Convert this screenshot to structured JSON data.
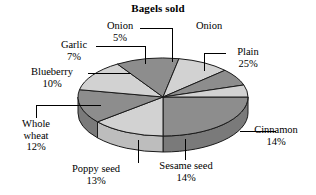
{
  "title": "Bagels sold",
  "colors": {
    "background": "#ffffff",
    "outline": "#1a1a1a",
    "slice_light": "#d2d2d2",
    "slice_dark": "#8d8d8d",
    "side_light": "#bdbdbd",
    "side_dark": "#7a7a7a",
    "leader": "#000000",
    "text": "#000000"
  },
  "chart_data": {
    "type": "pie",
    "title": "Bagels sold",
    "xlabel": "",
    "ylabel": "",
    "unit": "%",
    "legend": "labels-with-leader-lines",
    "grid": false,
    "three_d": true,
    "start_angle_deg": 0,
    "direction": "clockwise",
    "categories": [
      "Plain",
      "Cinnamon",
      "Sesame seed",
      "Poppy seed",
      "Whole wheat",
      "Blueberry",
      "Garlic",
      "Onion"
    ],
    "values": [
      25,
      14,
      14,
      13,
      12,
      10,
      7,
      5
    ],
    "slices": [
      {
        "label": "Plain",
        "percent": 25,
        "percent_text": "25%",
        "shade": "dark"
      },
      {
        "label": "Cinnamon",
        "percent": 14,
        "percent_text": "14%",
        "shade": "light"
      },
      {
        "label": "Sesame seed",
        "percent": 14,
        "percent_text": "14%",
        "shade": "dark"
      },
      {
        "label": "Poppy seed",
        "percent": 13,
        "percent_text": "13%",
        "shade": "light"
      },
      {
        "label": "Whole wheat",
        "percent": 12,
        "percent_text": "12%",
        "shade": "dark"
      },
      {
        "label": "Blueberry",
        "percent": 10,
        "percent_text": "10%",
        "shade": "light"
      },
      {
        "label": "Garlic",
        "percent": 7,
        "percent_text": "7%",
        "shade": "dark"
      },
      {
        "label": "Onion",
        "percent": 5,
        "percent_text": "5%",
        "shade": "light"
      }
    ]
  },
  "labels": {
    "onion": {
      "name": "Onion",
      "percent": "5%"
    },
    "garlic": {
      "name": "Garlic",
      "percent": "7%"
    },
    "blueberry": {
      "name": "Blueberry",
      "percent": "10%"
    },
    "whole_wheat": {
      "name_line1": "Whole",
      "name_line2": "wheat",
      "percent": "12%"
    },
    "poppy_seed": {
      "name": "Poppy seed",
      "percent": "13%"
    },
    "sesame_seed": {
      "name": "Sesame seed",
      "percent": "14%"
    },
    "cinnamon": {
      "name": "Cinnamon",
      "percent": "14%"
    },
    "plain": {
      "name": "Plain",
      "percent": "25%"
    }
  },
  "geometry": {
    "cx": 163,
    "cy": 97,
    "rx": 85,
    "ry": 39,
    "depth": 16
  }
}
